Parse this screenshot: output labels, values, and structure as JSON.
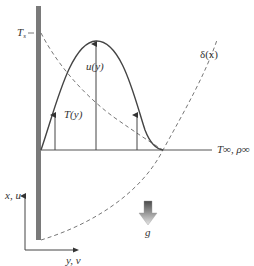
{
  "diagram": {
    "type": "natural-convection-boundary-layer",
    "labels": {
      "surface_temperature": "T",
      "surface_temperature_sub": "s",
      "velocity_profile": "u(y)",
      "temperature_profile": "T(y)",
      "boundary_layer_thickness": "δ(x)",
      "freestream": "T∞, ρ∞",
      "gravity": "g",
      "vertical_axis": "x, u",
      "horizontal_axis": "y, v"
    },
    "colors": {
      "wall": "#7a7a7a",
      "curve": "#444444",
      "dashed": "#666666",
      "gravity_arrow_top": "#555555",
      "gravity_arrow_bottom": "#dddddd"
    }
  }
}
